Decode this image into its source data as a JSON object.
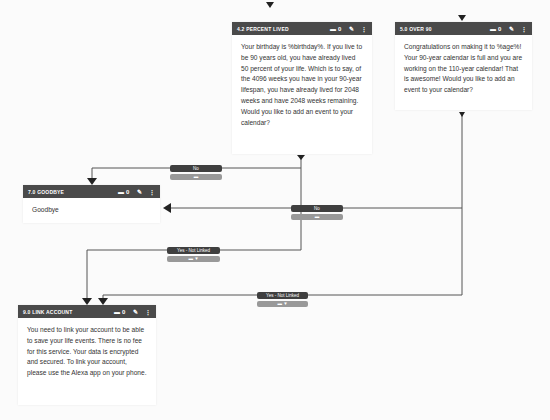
{
  "nodes": {
    "percent_lived": {
      "title": "4.2 Percent Lived",
      "comment_count": "0",
      "body": "Your birthday is %birthday%. If you live to be 90 years old, you have already lived 50 percent of your life. Which is to say, of the 4096 weeks you have in your 90-year lifespan, you have already lived for 2048 weeks and have 2048 weeks remaining. Would you like to add an event to your calendar?"
    },
    "over_90": {
      "title": "5.0 Over 90",
      "comment_count": "0",
      "body": "Congratulations on making it to %age%! Your 90-year calendar is full and you are working on the 110-year calendar! That is awesome! Would you like to add an event to your calendar?"
    },
    "goodbye": {
      "title": "7.0 Goodbye",
      "comment_count": "0",
      "body": "Goodbye"
    },
    "link_account": {
      "title": "9.0 Link Account",
      "comment_count": "0",
      "body": "You need to link your account to be able to save your life events. There is no fee for this service. Your data is encrypted and secured. To link your account, please use the Alexa app on your phone."
    }
  },
  "edges": {
    "no_1": {
      "label": "No"
    },
    "no_2": {
      "label": "No"
    },
    "yes_not_linked_1": {
      "label": "Yes - Not Linked"
    },
    "yes_not_linked_2": {
      "label": "Yes - Not Linked"
    }
  },
  "icons": {
    "comment": "▬",
    "edit": "✎",
    "more": "⋮",
    "filter": "▼"
  },
  "colors": {
    "header_bg": "#4a4a4a",
    "edge_label_bg": "#3f3f3f",
    "edge_sub_bg": "#999999",
    "line": "#555555"
  }
}
